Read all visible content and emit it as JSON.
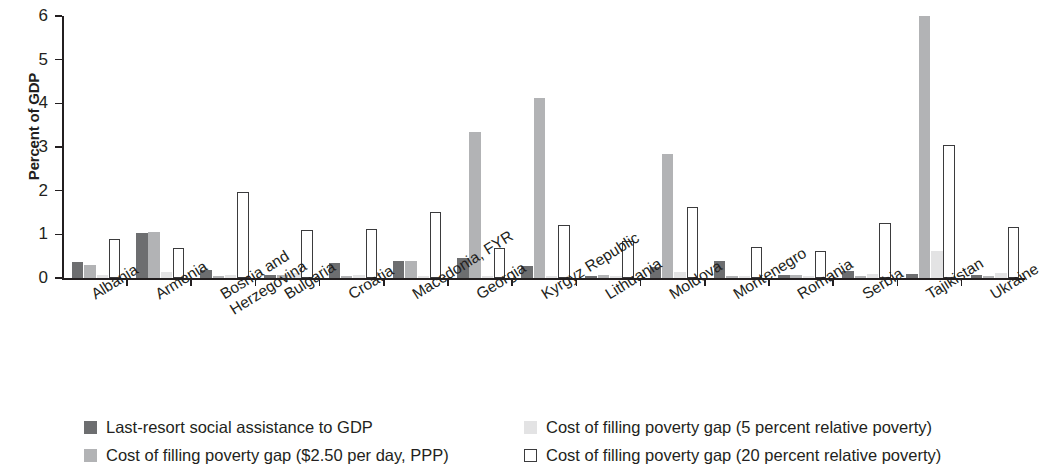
{
  "chart_data": {
    "type": "bar",
    "title": "",
    "xlabel": "",
    "ylabel": "Percent of GDP",
    "ylim": [
      0,
      6
    ],
    "yticks": [
      0,
      1,
      2,
      3,
      4,
      5,
      6
    ],
    "ytick_labels": [
      "0",
      "1",
      "2",
      "3",
      "4",
      "5",
      "6"
    ],
    "grid": false,
    "legend_position": "bottom",
    "categories": [
      "Albania",
      "Armenia",
      "Bosnia and Herzegovina",
      "Bulgaria",
      "Croatia",
      "Macedonia, FYR",
      "Georgia",
      "Kyrgyz Republic",
      "Lithuania",
      "Moldova",
      "Montenegro",
      "Romania",
      "Serbia",
      "Tajikistan",
      "Ukraine"
    ],
    "series": [
      {
        "name": "Last-resort social assistance to GDP",
        "color": "#6d6e70",
        "values": [
          0.37,
          1.03,
          0.18,
          0.06,
          0.34,
          0.4,
          0.45,
          0.28,
          0.04,
          0.25,
          0.4,
          0.08,
          0.15,
          0.1,
          0.08
        ]
      },
      {
        "name": "Cost of filling poverty gap ($2.50 per day, PPP)",
        "color": "#b2b3b5",
        "values": [
          0.3,
          1.05,
          0.02,
          0.07,
          0.02,
          0.4,
          3.35,
          4.13,
          0.06,
          2.85,
          0.02,
          0.08,
          0.02,
          6.0,
          0.02
        ]
      },
      {
        "name": "Cost of filling poverty gap (5 percent relative poverty)",
        "color": "#e3e3e4",
        "values": [
          0.08,
          0.13,
          0.08,
          0.12,
          0.08,
          0.05,
          0.05,
          0.04,
          0.05,
          0.13,
          0.04,
          0.05,
          0.1,
          0.62,
          0.12
        ]
      },
      {
        "name": "Cost of filling poverty gap (20 percent relative poverty)",
        "color": "#ffffff",
        "values": [
          0.89,
          0.68,
          1.98,
          1.1,
          1.12,
          1.52,
          0.68,
          1.22,
          0.84,
          1.62,
          0.72,
          0.62,
          1.27,
          3.05,
          1.17
        ]
      }
    ]
  },
  "legend": {
    "items": [
      {
        "label": "Last-resort social assistance to GDP",
        "swatch": "s0"
      },
      {
        "label": "Cost of filling poverty gap ($2.50 per day, PPP)",
        "swatch": "s1"
      },
      {
        "label": "Cost of filling poverty gap (5 percent relative poverty)",
        "swatch": "s2"
      },
      {
        "label": "Cost of filling poverty gap (20 percent relative poverty)",
        "swatch": "s3"
      }
    ]
  },
  "axis": {
    "y_title": "Percent of GDP"
  }
}
